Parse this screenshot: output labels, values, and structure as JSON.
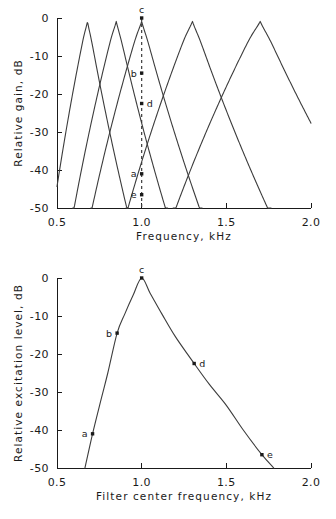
{
  "figure": {
    "panels": [
      "filter-gain-panel",
      "excitation-pattern-panel"
    ]
  },
  "chart_data": [
    {
      "id": "filter-gain",
      "type": "line",
      "title": "",
      "xlabel": "Frequency, kHz",
      "ylabel": "Relative gain, dB",
      "xlim": [
        0.5,
        2.0
      ],
      "ylim": [
        -50,
        0
      ],
      "xticks": [
        0.5,
        1.0,
        1.5,
        2.0
      ],
      "xtick_labels": [
        "0.5",
        "1.0",
        "1.5",
        "2.0"
      ],
      "yticks": [
        0,
        -10,
        -20,
        -30,
        -40,
        -50
      ],
      "ytick_labels": [
        "0",
        "-10",
        "-20",
        "-30",
        "-40",
        "-50"
      ],
      "grid": false,
      "legend": false,
      "probe_frequency": 1.0,
      "probe_style": "dashed-vertical",
      "series": [
        {
          "name": "filter-a",
          "center": 0.68,
          "peak_db": 0,
          "low_slope_db_per_oct": -100,
          "high_slope_db_per_oct": -118
        },
        {
          "name": "filter-b",
          "center": 0.85,
          "peak_db": 0,
          "low_slope_db_per_oct": -100,
          "high_slope_db_per_oct": -118
        },
        {
          "name": "filter-c",
          "center": 1.0,
          "peak_db": 0,
          "low_slope_db_per_oct": -100,
          "high_slope_db_per_oct": -118
        },
        {
          "name": "filter-d",
          "center": 1.3,
          "peak_db": 0,
          "low_slope_db_per_oct": -100,
          "high_slope_db_per_oct": -118
        },
        {
          "name": "filter-e",
          "center": 1.7,
          "peak_db": 0,
          "low_slope_db_per_oct": -100,
          "high_slope_db_per_oct": -118
        }
      ],
      "annotations": [
        {
          "label": "a",
          "x": 1.0,
          "y": -41.0,
          "label_side": "left"
        },
        {
          "label": "b",
          "x": 1.0,
          "y": -14.5,
          "label_side": "left"
        },
        {
          "label": "c",
          "x": 1.0,
          "y": 0.0,
          "label_side": "top"
        },
        {
          "label": "d",
          "x": 1.0,
          "y": -22.5,
          "label_side": "right"
        },
        {
          "label": "e",
          "x": 1.0,
          "y": -46.5,
          "label_side": "left"
        }
      ]
    },
    {
      "id": "excitation-pattern",
      "type": "line",
      "title": "",
      "xlabel": "Filter center frequency, kHz",
      "ylabel": "Relative excitation level, dB",
      "xlim": [
        0.5,
        2.0
      ],
      "ylim": [
        -50,
        0
      ],
      "xticks": [
        0.5,
        1.0,
        1.5,
        2.0
      ],
      "xtick_labels": [
        "0.5",
        "1.0",
        "1.5",
        "2.0"
      ],
      "yticks": [
        0,
        -10,
        -20,
        -30,
        -40,
        -50
      ],
      "ytick_labels": [
        "0",
        "-10",
        "-20",
        "-30",
        "-40",
        "-50"
      ],
      "grid": false,
      "legend": false,
      "series": [
        {
          "name": "excitation",
          "x": [
            0.665,
            0.71,
            0.76,
            0.8,
            0.855,
            0.9,
            0.95,
            1.0,
            1.05,
            1.12,
            1.2,
            1.31,
            1.4,
            1.5,
            1.6,
            1.71,
            1.78
          ],
          "y": [
            -50.0,
            -41.0,
            -32.0,
            -25.0,
            -14.5,
            -9.5,
            -4.5,
            0.0,
            -4.0,
            -9.5,
            -15.5,
            -22.5,
            -28.0,
            -33.5,
            -40.0,
            -46.5,
            -50.0
          ]
        }
      ],
      "annotations": [
        {
          "label": "a",
          "x": 0.71,
          "y": -41.0,
          "label_side": "left"
        },
        {
          "label": "b",
          "x": 0.855,
          "y": -14.5,
          "label_side": "left"
        },
        {
          "label": "c",
          "x": 1.0,
          "y": 0.0,
          "label_side": "top"
        },
        {
          "label": "d",
          "x": 1.31,
          "y": -22.5,
          "label_side": "right"
        },
        {
          "label": "e",
          "x": 1.71,
          "y": -46.5,
          "label_side": "right"
        }
      ]
    }
  ],
  "top_panel": {
    "ylabel": "Relative gain, dB",
    "xlabel": "Frequency, kHz",
    "xtick_labels": [
      "0.5",
      "1.0",
      "1.5",
      "2.0"
    ],
    "ytick_labels": [
      "0",
      "-10",
      "-20",
      "-30",
      "-40",
      "-50"
    ],
    "point_labels": {
      "a": "a",
      "b": "b",
      "c": "c",
      "d": "d",
      "e": "e"
    }
  },
  "bottom_panel": {
    "ylabel": "Relative excitation level, dB",
    "xlabel": "Filter center frequency, kHz",
    "xtick_labels": [
      "0.5",
      "1.0",
      "1.5",
      "2.0"
    ],
    "ytick_labels": [
      "0",
      "-10",
      "-20",
      "-30",
      "-40",
      "-50"
    ],
    "point_labels": {
      "a": "a",
      "b": "b",
      "c": "c",
      "d": "d",
      "e": "e"
    }
  },
  "colors": {
    "curve": "#3c3c3c",
    "axis": "#1a1a1a",
    "background": "#ffffff"
  }
}
